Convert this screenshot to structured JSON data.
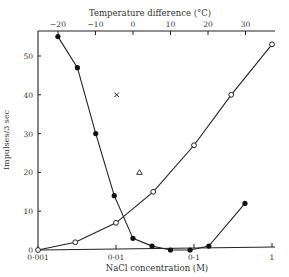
{
  "chart_data": {
    "type": "line",
    "title": "",
    "xlabel": "NaCl concentration (M)",
    "ylabel": "Impulses/3 sec",
    "x_scale": "log",
    "xlim": [
      0.001,
      1
    ],
    "ylim": [
      0,
      56
    ],
    "x_ticks": [
      0.001,
      0.01,
      0.1,
      1
    ],
    "x_tick_labels": [
      "0·001",
      "0·01",
      "0·1",
      "1"
    ],
    "y_ticks": [
      0,
      10,
      20,
      30,
      40,
      50
    ],
    "y_tick_labels": [
      "0",
      "10",
      "20",
      "30",
      "40",
      "50"
    ],
    "top_axis": {
      "label": "Temperature difference (°C)",
      "ticks": [
        -20,
        -10,
        0,
        10,
        20,
        30
      ],
      "tick_labels": [
        "−20",
        "−10",
        "0",
        "10",
        "20",
        "30"
      ],
      "note": "linear scale; -20°C aligns near 0.0018 M, 30°C near 0.45 M"
    },
    "grid": false,
    "legend": null,
    "series": [
      {
        "name": "filled circles (NaCl, decreasing)",
        "marker": "filled-circle",
        "connected": true,
        "x": [
          0.0018,
          0.0032,
          0.0055,
          0.0095,
          0.0165,
          0.029,
          0.05,
          0.089,
          0.155,
          0.45
        ],
        "y": [
          55,
          47,
          30,
          14,
          3,
          1,
          0,
          0,
          1,
          12
        ]
      },
      {
        "name": "open circles (NaCl, increasing)",
        "marker": "open-circle",
        "connected": true,
        "x": [
          0.001,
          0.003,
          0.01,
          0.03,
          0.1,
          0.3,
          1
        ],
        "y": [
          0,
          2,
          7,
          15,
          27,
          40,
          53
        ]
      },
      {
        "name": "cross",
        "marker": "cross",
        "connected": false,
        "x": [
          0.0102
        ],
        "y": [
          40
        ]
      },
      {
        "name": "triangle",
        "marker": "open-triangle",
        "connected": false,
        "x": [
          0.02
        ],
        "y": [
          20
        ]
      }
    ]
  }
}
